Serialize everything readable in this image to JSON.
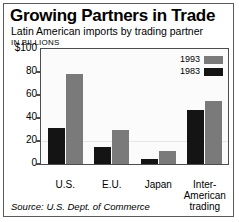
{
  "chart_data": {
    "type": "bar",
    "title": "Growing Partners in Trade",
    "subtitle": "Latin American imports by trading partner",
    "units_label": "IN BILLIONS",
    "xlabel": "",
    "ylabel": "",
    "ylim": [
      0,
      100
    ],
    "yticks": [
      "$100",
      "80",
      "60",
      "40",
      "20",
      "0"
    ],
    "ytick_values": [
      100,
      80,
      60,
      40,
      20,
      0
    ],
    "grid": false,
    "legend_position": "top-right inside plot",
    "categories": [
      "U.S.",
      "E.U.",
      "Japan",
      "Inter-American trading"
    ],
    "category_labels": [
      "U.S.",
      "E.U.",
      "Japan",
      "Inter-\nAmerican\ntrading"
    ],
    "series": [
      {
        "name": "1993",
        "color": "#7a7a7a",
        "values": [
          78,
          30,
          11,
          55
        ]
      },
      {
        "name": "1983",
        "color": "#141414",
        "values": [
          31,
          15,
          4,
          47
        ]
      }
    ],
    "source": "Source: U.S. Dept. of Commerce"
  },
  "legend": {
    "items": [
      {
        "label": "1993",
        "swatch": "gray-swatch"
      },
      {
        "label": "1983",
        "swatch": "black-swatch"
      }
    ]
  },
  "colors": {
    "series_1993": "#7a7a7a",
    "series_1983": "#141414",
    "axis": "#4d4d4d",
    "border": "#5a5a5a",
    "plot_background": "#fbfbfb"
  }
}
